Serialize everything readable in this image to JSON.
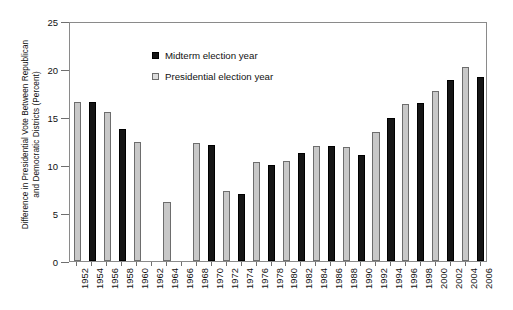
{
  "chart_data": {
    "type": "bar",
    "title": "",
    "xlabel": "",
    "ylabel": "Difference in Presidential Vote Between Republican and Democratic Districts (Percent)",
    "ylabel_line1": "Difference in Presidential Vote Between Republican",
    "ylabel_line2": "and Democratic Districts  (Percent)",
    "ylim": [
      0,
      25
    ],
    "yticks": [
      0,
      5,
      10,
      15,
      20,
      25
    ],
    "ytick_labels": [
      "0",
      "5",
      "10",
      "15",
      "20",
      "25"
    ],
    "grid": false,
    "legend_position": "upper-center-left",
    "categories": [
      "1952",
      "1954",
      "1956",
      "1958",
      "1960",
      "1962",
      "1964",
      "1966",
      "1968",
      "1970",
      "1972",
      "1974",
      "1976",
      "1978",
      "1980",
      "1982",
      "1984",
      "1986",
      "1988",
      "1990",
      "1992",
      "1994",
      "1996",
      "1998",
      "2000",
      "2002",
      "2004",
      "2006"
    ],
    "series": [
      {
        "name": "Midterm election year",
        "color": "#151515",
        "values": [
          null,
          16.6,
          null,
          13.7,
          null,
          null,
          null,
          null,
          null,
          12.1,
          null,
          7.0,
          null,
          10.0,
          null,
          11.3,
          null,
          12.0,
          null,
          11.0,
          null,
          14.9,
          null,
          16.5,
          null,
          18.9,
          null,
          19.2
        ]
      },
      {
        "name": "Presidential election year",
        "color": "#c8c8c8",
        "values": [
          16.6,
          null,
          15.5,
          null,
          12.4,
          null,
          6.1,
          null,
          12.3,
          null,
          7.3,
          null,
          10.3,
          null,
          10.4,
          null,
          12.0,
          null,
          11.9,
          null,
          13.4,
          null,
          16.4,
          null,
          17.7,
          null,
          20.2,
          null
        ]
      }
    ]
  },
  "legend": {
    "items": [
      {
        "label": "Midterm election year",
        "swatch": "midterm"
      },
      {
        "label": "Presidential election year",
        "swatch": "presidential"
      }
    ]
  }
}
